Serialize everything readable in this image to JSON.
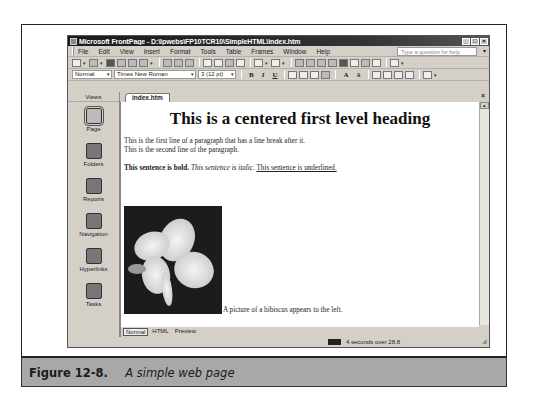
{
  "window": {
    "title": "Microsoft FrontPage - D:\\Ipwebs\\FP10TCR10\\SimpleHTML\\index.htm",
    "controls": [
      "minimize",
      "maximize",
      "close"
    ]
  },
  "menubar": {
    "items": [
      "File",
      "Edit",
      "View",
      "Insert",
      "Format",
      "Tools",
      "Table",
      "Frames",
      "Window",
      "Help"
    ],
    "help_placeholder": "Type a question for help"
  },
  "format_toolbar": {
    "style": "Normal",
    "font": "Times New Roman",
    "size": "3 (12 pt)",
    "bold": "B",
    "italic": "I",
    "underline": "U"
  },
  "views": {
    "header": "Views",
    "items": [
      {
        "label": "Page",
        "icon": "page-icon",
        "active": true
      },
      {
        "label": "Folders",
        "icon": "folders-icon"
      },
      {
        "label": "Reports",
        "icon": "reports-icon"
      },
      {
        "label": "Navigation",
        "icon": "navigation-icon"
      },
      {
        "label": "Hyperlinks",
        "icon": "hyperlinks-icon"
      },
      {
        "label": "Tasks",
        "icon": "tasks-icon"
      }
    ]
  },
  "document": {
    "tab": "index.htm",
    "heading": "This is a centered first level heading",
    "line1": "This is the first line of a paragraph that has a line break after it.",
    "line2": "This is the second line of the paragraph.",
    "bold_sentence": "This sentence is bold.",
    "italic_sentence": "This sentence is italic.",
    "underlined_sentence": "This sentence is underlined.",
    "image_caption": "A picture of a hibiscus appears to the left."
  },
  "view_tabs": [
    "Normal",
    "HTML",
    "Preview"
  ],
  "statusbar": {
    "download_time": "4 seconds over 28.8"
  },
  "figure": {
    "number": "Figure 12-8.",
    "caption": "A simple web page"
  }
}
